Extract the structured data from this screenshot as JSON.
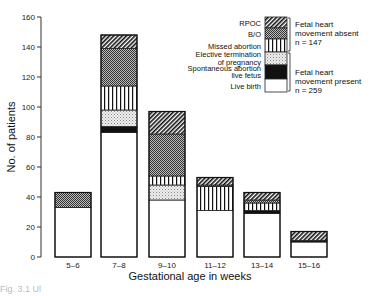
{
  "chart_data": {
    "type": "bar",
    "stacked": true,
    "title": "",
    "xlabel": "Gestational age in weeks",
    "ylabel": "No. of patients",
    "ylim": [
      0,
      160
    ],
    "yticks": [
      0,
      20,
      40,
      60,
      80,
      100,
      120,
      140,
      160
    ],
    "grid": false,
    "legend_position": "upper right",
    "categories": [
      "5–6",
      "7–8",
      "9–10",
      "11–12",
      "13–14",
      "15–16"
    ],
    "series": [
      {
        "name": "Live birth",
        "pattern": "white",
        "values": [
          33,
          83,
          38,
          31,
          29,
          10
        ]
      },
      {
        "name": "Spontaneous abortion live fetus",
        "pattern": "black",
        "values": [
          0,
          4,
          0,
          0,
          2,
          1
        ]
      },
      {
        "name": "Elective termination of pregnancy",
        "pattern": "stipple",
        "values": [
          0,
          11,
          10,
          0,
          0,
          0
        ]
      },
      {
        "name": "Missed abortion",
        "pattern": "vertical-lines",
        "values": [
          0,
          16,
          6,
          16,
          5,
          0
        ]
      },
      {
        "name": "B/O",
        "pattern": "crosshatch",
        "values": [
          10,
          25,
          28,
          1,
          2,
          0
        ]
      },
      {
        "name": "RPOC",
        "pattern": "diagonal",
        "values": [
          0,
          9,
          15,
          5,
          5,
          6
        ]
      }
    ],
    "totals": [
      43,
      148,
      97,
      53,
      43,
      17
    ],
    "legend_groups": [
      {
        "label_lines": [
          "Fetal heart",
          "movement absent",
          "n = 147"
        ],
        "members": [
          "RPOC",
          "B/O",
          "Missed abortion"
        ]
      },
      {
        "label_lines": [
          "Fetal heart",
          "movement present",
          "n = 259"
        ],
        "members": [
          "Elective termination of pregnancy",
          "Spontaneous abortion live fetus",
          "Live birth"
        ]
      }
    ]
  },
  "legend": {
    "items": [
      {
        "lines": [
          "RPOC"
        ],
        "pattern": "diagonal"
      },
      {
        "lines": [
          "B/O"
        ],
        "pattern": "crosshatch"
      },
      {
        "lines": [
          "Missed abortion"
        ],
        "pattern": "vertical-lines"
      },
      {
        "lines": [
          "Elective termination",
          "of pregnancy"
        ],
        "pattern": "stipple"
      },
      {
        "lines": [
          "Spontaneous abortion",
          "live fetus"
        ],
        "pattern": "black"
      },
      {
        "lines": [
          "Live birth"
        ],
        "pattern": "white"
      }
    ],
    "group_absent": [
      "Fetal heart",
      "movement absent",
      "n = 147"
    ],
    "group_present": [
      "Fetal heart",
      "movement present",
      "n = 259"
    ]
  },
  "caption": "Fig. 3.1 Ul"
}
